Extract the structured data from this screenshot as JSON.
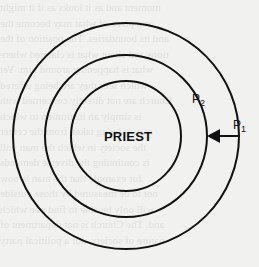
{
  "diagram": {
    "center_label": "PRIEST",
    "p2_label": "P",
    "p2_sub": "2",
    "p1_label": "P",
    "p1_sub": "1",
    "circles": [
      {
        "name": "outer",
        "cx": 126,
        "cy": 136,
        "r": 113
      },
      {
        "name": "middle",
        "cx": 126,
        "cy": 136,
        "r": 81
      },
      {
        "name": "inner",
        "cx": 126,
        "cy": 136,
        "r": 55
      }
    ],
    "arrow": {
      "from_x": 238,
      "to_x": 207,
      "y": 136
    },
    "stroke_color": "#111111"
  },
  "bleed_through": {
    "lines": [
      "moment and as it looks as if it might",
      "as a piece of what may become the",
      "and its boundaries. The position of the",
      "tions and about what is claimed where",
      "what is happening around him. Yet",
      "which sees they are being offered",
      "Church are not directly concerned with",
      "is simply an institution to which",
      "man is being taken from the center",
      "the society in which the man will",
      "is continuing the diverse demands",
      "for example that the man is now",
      "not to be measured by those outside",
      "will only be able to find one which",
      "and. The Church is not department of",
      "nature of society, nor a political party"
    ]
  }
}
